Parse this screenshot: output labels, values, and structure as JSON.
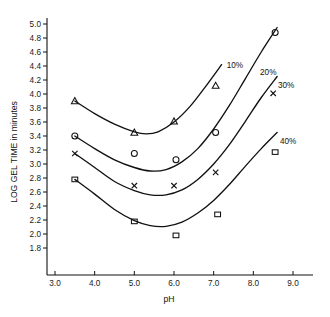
{
  "chart_data": {
    "type": "line",
    "title": "",
    "xlabel": "pH",
    "ylabel": "LOG GEL TIME in minutes",
    "xlim": [
      3.0,
      9.0
    ],
    "ylim": [
      1.75,
      5.05
    ],
    "grid": false,
    "legend_position": "inline-right-of-curves",
    "x_ticks": [
      "3.0",
      "4.0",
      "5.0",
      "6.0",
      "7.0",
      "8.0",
      "9.0"
    ],
    "x_tick_values": [
      3.0,
      4.0,
      5.0,
      6.0,
      7.0,
      8.0,
      9.0
    ],
    "y_ticks": [
      "1.8",
      "2.0",
      "2.2",
      "2.4",
      "2.6",
      "2.8",
      "3.0",
      "3.2",
      "3.4",
      "3.6",
      "3.8",
      "4.0",
      "4.2",
      "4.4",
      "4.6",
      "4.8",
      "5.0"
    ],
    "y_tick_values": [
      1.8,
      2.0,
      2.2,
      2.4,
      2.6,
      2.8,
      3.0,
      3.2,
      3.4,
      3.6,
      3.8,
      4.0,
      4.2,
      4.4,
      4.6,
      4.8,
      5.0
    ],
    "series": [
      {
        "name": "10%",
        "marker": "triangle",
        "label": "10%",
        "label_x": 7.33,
        "label_y": 4.42,
        "points_x": [
          3.5,
          5.0,
          6.0,
          7.05
        ],
        "points_y": [
          3.9,
          3.45,
          3.61,
          4.12
        ],
        "curve_x": [
          3.5,
          4.0,
          4.5,
          5.0,
          5.3,
          5.6,
          6.0,
          6.4,
          6.8,
          7.2
        ],
        "curve_y": [
          3.9,
          3.72,
          3.57,
          3.46,
          3.43,
          3.46,
          3.6,
          3.82,
          4.11,
          4.42
        ]
      },
      {
        "name": "20%",
        "marker": "circle",
        "label": "20%",
        "label_x": 8.17,
        "label_y": 4.32,
        "points_x": [
          3.5,
          5.0,
          6.05,
          7.05,
          8.55
        ],
        "points_y": [
          3.4,
          3.15,
          3.06,
          3.45,
          4.88
        ],
        "curve_x": [
          3.5,
          4.0,
          4.5,
          5.0,
          5.4,
          5.8,
          6.2,
          6.6,
          7.0,
          7.4,
          7.8,
          8.2,
          8.6
        ],
        "curve_y": [
          3.4,
          3.22,
          3.06,
          2.95,
          2.9,
          2.92,
          3.03,
          3.22,
          3.5,
          3.84,
          4.22,
          4.6,
          4.95
        ]
      },
      {
        "name": "30%",
        "marker": "x",
        "label": "30%",
        "label_x": 8.62,
        "label_y": 4.13,
        "points_x": [
          3.5,
          5.0,
          6.0,
          7.05,
          8.5
        ],
        "points_y": [
          3.15,
          2.69,
          2.69,
          2.88,
          4.01
        ],
        "curve_x": [
          3.5,
          4.0,
          4.5,
          5.0,
          5.4,
          5.8,
          6.2,
          6.6,
          7.0,
          7.4,
          7.8,
          8.2,
          8.6
        ],
        "curve_y": [
          3.15,
          2.95,
          2.75,
          2.62,
          2.56,
          2.56,
          2.63,
          2.78,
          3.0,
          3.28,
          3.61,
          3.95,
          4.25
        ]
      },
      {
        "name": "40%",
        "marker": "square",
        "label": "40%",
        "label_x": 8.67,
        "label_y": 3.33,
        "points_x": [
          3.5,
          5.0,
          6.05,
          7.1,
          8.55
        ],
        "points_y": [
          2.78,
          2.18,
          1.98,
          2.28,
          3.17
        ],
        "curve_x": [
          3.5,
          4.0,
          4.5,
          5.0,
          5.4,
          5.8,
          6.2,
          6.6,
          7.0,
          7.4,
          7.8,
          8.2,
          8.6
        ],
        "curve_y": [
          2.78,
          2.57,
          2.35,
          2.19,
          2.12,
          2.11,
          2.17,
          2.3,
          2.48,
          2.71,
          2.97,
          3.22,
          3.45
        ]
      }
    ]
  },
  "axes": {
    "x_axis_name": "pH",
    "y_axis_name": "LOG GEL TIME in minutes"
  },
  "colors": {
    "ink": "#111111",
    "background": "#ffffff"
  }
}
